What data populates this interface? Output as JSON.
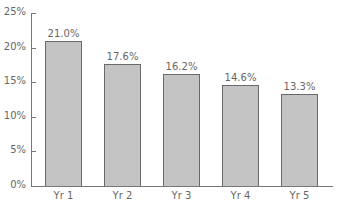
{
  "chart_data": {
    "type": "bar",
    "title": "",
    "xlabel": "",
    "ylabel": "",
    "categories": [
      "Yr 1",
      "Yr 2",
      "Yr 3",
      "Yr 4",
      "Yr 5"
    ],
    "values": [
      21.0,
      17.6,
      16.2,
      14.6,
      13.3
    ],
    "value_labels": [
      "21.0%",
      "17.6%",
      "16.2%",
      "14.6%",
      "13.3%"
    ],
    "ylim": [
      0,
      25
    ],
    "yticks": [
      0,
      5,
      10,
      15,
      20,
      25
    ],
    "ytick_labels": [
      "0%",
      "5%",
      "10%",
      "15%",
      "20%",
      "25%"
    ],
    "grid": false,
    "legend": null,
    "colors": {
      "bar_fill": "#c4c4c4",
      "bar_border": "#6a6a6a",
      "axis": "#777777",
      "text": "#666666"
    }
  }
}
